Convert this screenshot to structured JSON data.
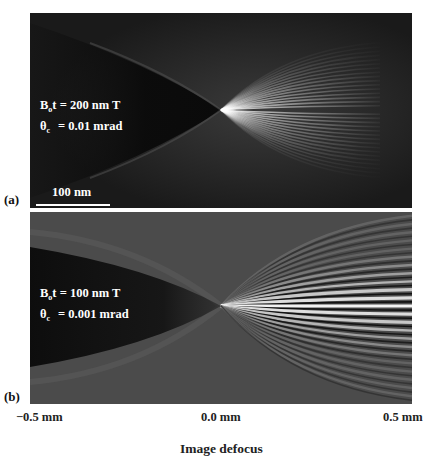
{
  "figure": {
    "panels": [
      {
        "label": "(a)",
        "param1_symbol": "B",
        "param1_sub": "o",
        "param1_rest": "t = 200 nm T",
        "param2_symbol": "θ",
        "param2_sub": "c",
        "param2_rest": "= 0.01 mrad",
        "scalebar": "100 nm"
      },
      {
        "label": "(b)",
        "param1_symbol": "B",
        "param1_sub": "o",
        "param1_rest": "t = 100 nm T",
        "param2_symbol": "θ",
        "param2_sub": "c",
        "param2_rest": "= 0.001 mrad"
      }
    ],
    "x_ticks": [
      "−0.5 mm",
      "0.0 mm",
      "0.5 mm"
    ],
    "x_label": "Image defocus"
  },
  "chart_data": {
    "type": "heatmap",
    "title": "",
    "xlabel": "Image defocus",
    "ylabel": "",
    "x_ticks": [
      "−0.5 mm",
      "0.0 mm",
      "0.5 mm"
    ],
    "x_range_mm": [
      -0.5,
      0.5
    ],
    "panels": [
      {
        "label": "(a)",
        "Bo_t": "200 nm T",
        "theta_c": "0.01 mrad",
        "scalebar": "100 nm",
        "description": "Through-focus image series; dark cone converging to focus at 0.0 mm, many fine interference fringes fanning out for positive defocus"
      },
      {
        "label": "(b)",
        "Bo_t": "100 nm T",
        "theta_c": "0.001 mrad",
        "description": "Through-focus image series; dark cone converging at 0.0 mm, fewer but higher-contrast interference fringes for positive defocus"
      }
    ],
    "colormap": "grayscale"
  }
}
